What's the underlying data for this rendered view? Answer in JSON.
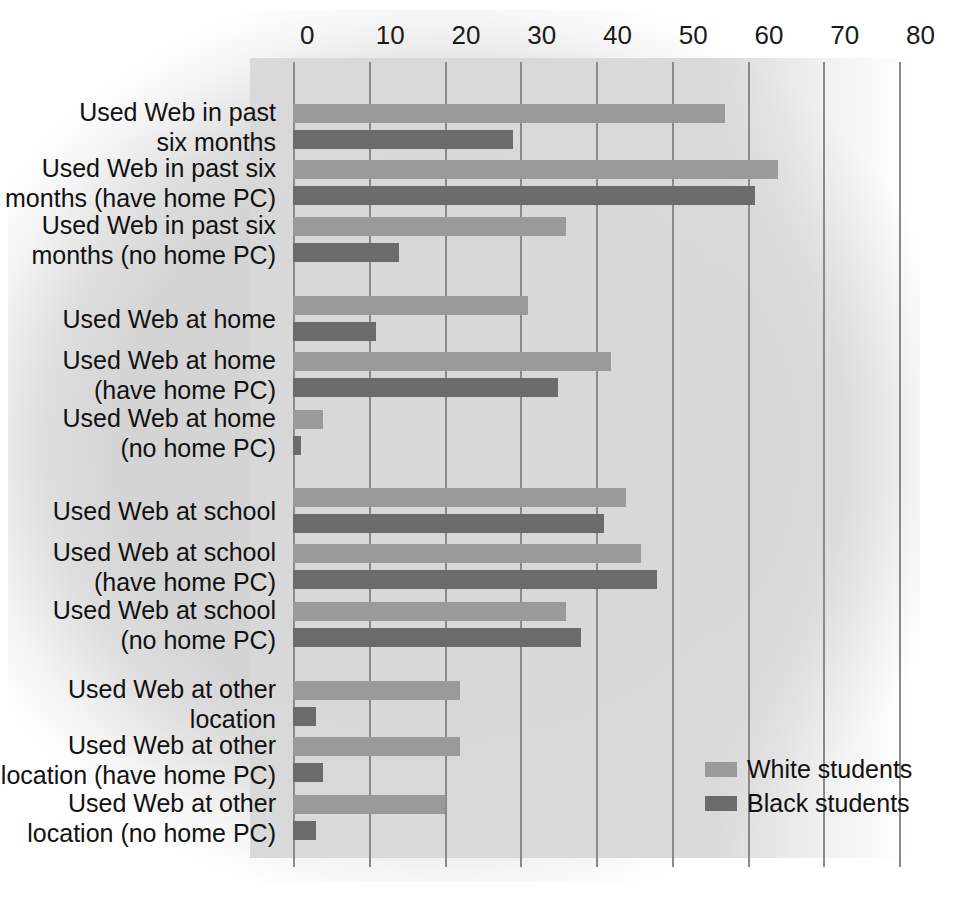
{
  "chart_data": {
    "type": "bar",
    "orientation": "horizontal",
    "title": "",
    "xlabel": "",
    "ylabel": "",
    "xlim": [
      0,
      80
    ],
    "xticks": [
      0,
      10,
      20,
      30,
      40,
      50,
      60,
      70,
      80
    ],
    "xtick_labels": [
      "0",
      "10",
      "20",
      "30",
      "40",
      "50",
      "60",
      "70",
      "80"
    ],
    "grid": true,
    "legend_position": "bottom-right",
    "categories": [
      "Used Web in past\nsix months",
      "Used Web in past six\nmonths (have home PC)",
      "Used Web in past six\nmonths (no home PC)",
      "Used Web at home",
      "Used Web at home\n(have home PC)",
      "Used Web at home\n(no home PC)",
      "Used Web at school",
      "Used Web at school\n(have home PC)",
      "Used Web at school\n(no home PC)",
      "Used Web at other\nlocation",
      "Used Web at other\nlocation (have home PC)",
      "Used Web at other\nlocation (no home PC)"
    ],
    "series": [
      {
        "name": "White students",
        "color": "#9a9a9a",
        "values": [
          57,
          64,
          36,
          31,
          42,
          4,
          44,
          46,
          36,
          22,
          22,
          20
        ]
      },
      {
        "name": "Black students",
        "color": "#6b6b6b",
        "values": [
          29,
          61,
          14,
          11,
          35,
          1,
          41,
          48,
          38,
          3,
          4,
          3
        ]
      }
    ]
  },
  "legend": {
    "items": [
      {
        "label": "White students",
        "series": "white"
      },
      {
        "label": "Black students",
        "series": "black"
      }
    ]
  },
  "colors": {
    "white_series": "#9a9a9a",
    "black_series": "#6b6b6b",
    "gridline": "#8a8a8a",
    "backdrop": "#d4d4d4",
    "text": "#111111"
  }
}
